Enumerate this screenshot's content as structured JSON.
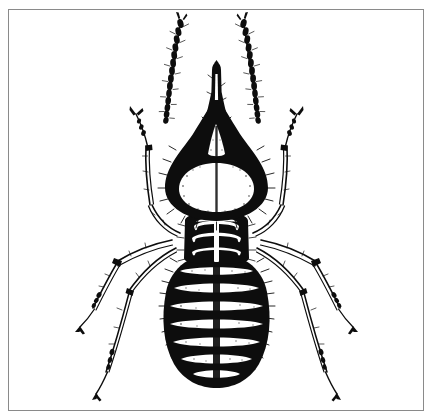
{
  "figure": {
    "kind": "scientific-illustration",
    "subject": "nasute termite soldier",
    "view": "dorsal",
    "medium": "black-and-white pen-and-ink line drawing (scanned halftone)",
    "caption": "",
    "alt_text": "Dorsal view line drawing of a nasute termite soldier showing pointed nasus, dark pear-shaped head, beaded antennae, three-segmented thorax and banded hairy abdomen with six legs",
    "background_color": "#ffffff",
    "ink_color": "#0d0d0d",
    "frame": {
      "color": "#8a8a8a",
      "thickness_px": 1,
      "left_px": 8,
      "top_px": 9,
      "width_px": 416,
      "height_px": 402
    },
    "canvas": {
      "width_px": 433,
      "height_px": 420
    },
    "anatomy": {
      "nasus_label": "nasus",
      "head_label": "head capsule",
      "antenna_left_label": "left antenna",
      "antenna_right_label": "right antenna",
      "antenna_segment_count": 14,
      "pronotum_label": "pronotum",
      "mesonotum_label": "mesonotum",
      "metanotum_label": "metanotum",
      "abdomen_label": "abdomen",
      "abdomen_segment_count": 7,
      "leg_labels": [
        "left foreleg",
        "right foreleg",
        "left midleg",
        "right midleg",
        "left hindleg",
        "right hindleg"
      ]
    }
  }
}
